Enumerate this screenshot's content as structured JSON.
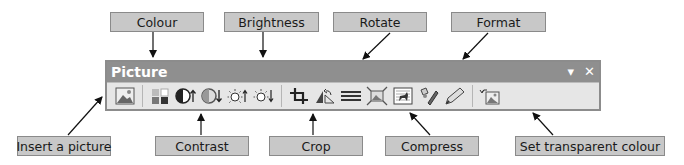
{
  "toolbar": {
    "title": "Picture",
    "dropdown_glyph": "▾",
    "close_glyph": "✕",
    "buttons": [
      {
        "id": "insert-picture",
        "icon": "picture-icon"
      },
      {
        "id": "color",
        "icon": "color-icon"
      },
      {
        "id": "more-contrast",
        "icon": "contrast-up-icon"
      },
      {
        "id": "less-contrast",
        "icon": "contrast-down-icon"
      },
      {
        "id": "more-brightness",
        "icon": "brightness-up-icon"
      },
      {
        "id": "less-brightness",
        "icon": "brightness-down-icon"
      },
      {
        "id": "crop",
        "icon": "crop-icon"
      },
      {
        "id": "rotate",
        "icon": "rotate-left-icon"
      },
      {
        "id": "line-style",
        "icon": "line-style-icon"
      },
      {
        "id": "compress",
        "icon": "compress-icon"
      },
      {
        "id": "text-wrapping",
        "icon": "text-wrapping-icon"
      },
      {
        "id": "format-picture",
        "icon": "format-picture-icon"
      },
      {
        "id": "set-transparent",
        "icon": "set-transparent-icon"
      },
      {
        "id": "reset-picture",
        "icon": "reset-picture-icon"
      }
    ]
  },
  "callouts": {
    "colour": "Colour",
    "brightness": "Brightness",
    "rotate": "Rotate",
    "format": "Format",
    "insert_picture": "Insert a picture",
    "contrast": "Contrast",
    "crop": "Crop",
    "compress": "Compress",
    "set_transparent": "Set transparent colour"
  },
  "colors": {
    "callout_bg": "#c8c8c8",
    "titlebar_bg": "#8f8f8f",
    "toolbar_bg": "#e6e6e6"
  }
}
